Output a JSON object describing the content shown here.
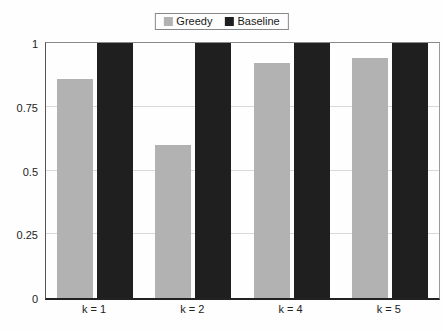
{
  "chart_data": {
    "type": "bar",
    "categories": [
      "k = 1",
      "k = 2",
      "k = 4",
      "k = 5"
    ],
    "series": [
      {
        "name": "Greedy",
        "color": "#b2b2b2",
        "values": [
          0.86,
          0.6,
          0.92,
          0.94
        ]
      },
      {
        "name": "Baseline",
        "color": "#1f1f1f",
        "values": [
          1.0,
          1.0,
          1.0,
          1.0
        ]
      }
    ],
    "title": "",
    "xlabel": "",
    "ylabel": "",
    "ylim": [
      0,
      1
    ],
    "yticks": [
      0,
      0.25,
      0.5,
      0.75,
      1
    ],
    "ytick_labels": [
      "0",
      "0.25",
      "0.5",
      "0.75",
      "1"
    ],
    "grid": true,
    "legend_position": "top-center"
  },
  "colors": {
    "grid": "#d9d9d9",
    "axis": "#222222",
    "frame": "#999999",
    "background": "#fefefe",
    "text": "#1a1a1a"
  }
}
